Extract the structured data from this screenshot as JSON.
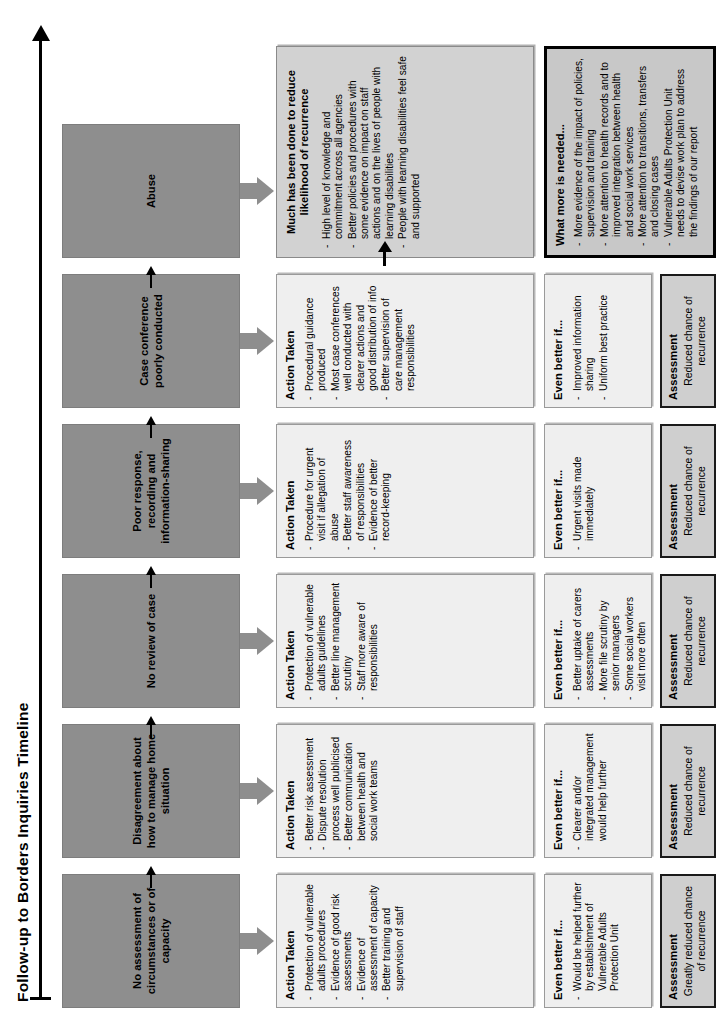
{
  "diagram": {
    "title": "Follow-up to Borders Inquiries Timeline",
    "panel_titles": {
      "action": "Action Taken",
      "better": "Even better if...",
      "assessment": "Assessment"
    },
    "columns": [
      {
        "stage": "No assessment of circumstances or of capacity",
        "action_taken": [
          "Protection of vulnerable adults procedures",
          "Evidence of good risk assessments",
          "Evidence of assessment of capacity",
          "Better training and supervision of staff"
        ],
        "even_better_if": [
          "Would be helped further by establishment of Vulnerable Adults Protection Unit"
        ],
        "assessment": "Greatly reduced chance of recurrence"
      },
      {
        "stage": "Disagreement about how to manage home situation",
        "action_taken": [
          "Better risk assessment",
          "Dispute resolution process well publicised",
          "Better communication between health and social work teams"
        ],
        "even_better_if": [
          "Clearer and/or integrated management would help further"
        ],
        "assessment": "Reduced chance of recurrence"
      },
      {
        "stage": "No review of case",
        "action_taken": [
          "Protection of vulnerable adults guidelines",
          "Better line management scrutiny",
          "Staff more aware of responsibilities"
        ],
        "even_better_if": [
          "Better uptake of carers assessments",
          "More file scrutiny by senior managers",
          "Some social workers visit more often"
        ],
        "assessment": "Reduced chance of recurrence"
      },
      {
        "stage": "Poor response, recording and information-sharing",
        "action_taken": [
          "Procedure for urgent visit if allegation of abuse",
          "Better staff awareness of responsibilities",
          "Evidence of better record-keeping"
        ],
        "even_better_if": [
          "Urgent visits made immediately"
        ],
        "assessment": "Reduced chance of recurrence"
      },
      {
        "stage": "Case conference poorly conducted",
        "action_taken": [
          "Procedural guidance produced",
          "Most case conferences well conducted with clearer actions and good distribution of info",
          "Better supervision of care management responsibilities"
        ],
        "even_better_if": [
          "Improved information sharing",
          "Uniform best practice"
        ],
        "assessment": "Reduced chance of recurrence"
      }
    ],
    "final_column": {
      "stage": "Abuse",
      "summary_title": "Much has been done to reduce likelihood of recurrence",
      "summary_items": [
        "High level of knowledge and commitment across all agencies",
        "Better policies and procedures with some evidence on impact on staff actions and on the lives of people with learning disabilities",
        "People with learning disabilities feel safe and supported"
      ],
      "needed_title": "What more is needed...",
      "needed_items": [
        "More evidence of the impact of policies, supervision and training",
        "More attention to health records and to improved integration between health and social work services",
        "More attention to transitions, transfers and closing cases",
        "Vulnerable Adults Protection Unit needs to devise work plan to address the findings of our report"
      ]
    }
  }
}
